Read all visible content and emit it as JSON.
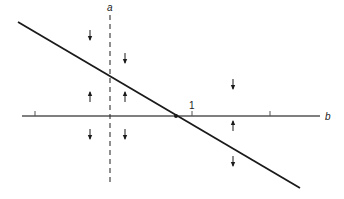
{
  "diagram": {
    "axis_label_horizontal": "b",
    "axis_label_vertical": "a",
    "tick_label": "1",
    "colors": {
      "line": "#1a1a1a",
      "axis": "#555555",
      "background": "#ffffff"
    },
    "elements": {
      "horizontal_axis": {
        "y": 116,
        "x_start": 22,
        "x_end": 320
      },
      "ticks_x": [
        35,
        192,
        270
      ],
      "labeled_tick_x": 192,
      "dashed_vertical": {
        "x": 110,
        "y_start": 15,
        "y_end": 184
      },
      "diagonal_line": {
        "x1": 18,
        "y1": 22,
        "x2": 300,
        "y2": 188
      },
      "intersection_point": {
        "x": 176,
        "y": 116
      },
      "arrows": [
        {
          "x": 90,
          "y": 35,
          "dir": "down"
        },
        {
          "x": 125,
          "y": 58,
          "dir": "down"
        },
        {
          "x": 233,
          "y": 84,
          "dir": "down"
        },
        {
          "x": 90,
          "y": 97,
          "dir": "up"
        },
        {
          "x": 125,
          "y": 97,
          "dir": "up"
        },
        {
          "x": 233,
          "y": 126,
          "dir": "up"
        },
        {
          "x": 90,
          "y": 134,
          "dir": "down"
        },
        {
          "x": 125,
          "y": 134,
          "dir": "down"
        },
        {
          "x": 233,
          "y": 161,
          "dir": "down"
        }
      ]
    }
  }
}
